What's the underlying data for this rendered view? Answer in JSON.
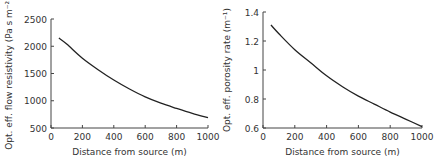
{
  "chart_data": [
    {
      "type": "line",
      "title": "",
      "xlabel": "Distance from source (m)",
      "ylabel": "Opt. eff. flow resistivity (Pa s m⁻²)",
      "xlim": [
        0,
        1000
      ],
      "ylim": [
        500,
        2500
      ],
      "xticks": [
        0,
        200,
        400,
        600,
        800,
        1000
      ],
      "yticks": [
        500,
        1000,
        1500,
        2000,
        2500
      ],
      "xtick_labels": [
        "0",
        "200",
        "400",
        "600",
        "800",
        "1000"
      ],
      "ytick_labels": [
        "500",
        "1000",
        "1500",
        "2000",
        "2500"
      ],
      "grid": false,
      "series": [
        {
          "name": "flow resistivity",
          "x": [
            50,
            100,
            200,
            300,
            400,
            500,
            600,
            700,
            800,
            900,
            1000
          ],
          "y": [
            2150,
            2040,
            1780,
            1570,
            1380,
            1215,
            1070,
            955,
            860,
            770,
            690
          ]
        }
      ]
    },
    {
      "type": "line",
      "title": "",
      "xlabel": "Distance from source (m)",
      "ylabel": "Opt. eff. porosity rate (m⁻¹)",
      "xlim": [
        0,
        1000
      ],
      "ylim": [
        0.6,
        1.4
      ],
      "xticks": [
        0,
        200,
        400,
        600,
        800,
        1000
      ],
      "yticks": [
        0.6,
        0.8,
        1.0,
        1.2,
        1.4
      ],
      "xtick_labels": [
        "0",
        "200",
        "400",
        "600",
        "800",
        "1000"
      ],
      "ytick_labels": [
        "0.6",
        "0.8",
        "1",
        "1.2",
        "1.4"
      ],
      "grid": false,
      "series": [
        {
          "name": "porosity rate",
          "x": [
            50,
            100,
            200,
            300,
            400,
            500,
            600,
            700,
            800,
            900,
            1000
          ],
          "y": [
            1.31,
            1.25,
            1.14,
            1.05,
            0.96,
            0.885,
            0.82,
            0.765,
            0.71,
            0.66,
            0.61
          ]
        }
      ]
    }
  ]
}
